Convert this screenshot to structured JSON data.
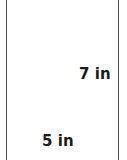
{
  "figure": {
    "shape": "rectangle",
    "outline_color": "#4a4a4a",
    "background_color": "#ffffff",
    "text_color": "#1a1a1a",
    "labels": {
      "height": "7 in",
      "width": "5 in"
    },
    "dimensions": {
      "height_value": 7,
      "width_value": 5,
      "unit": "in"
    }
  }
}
